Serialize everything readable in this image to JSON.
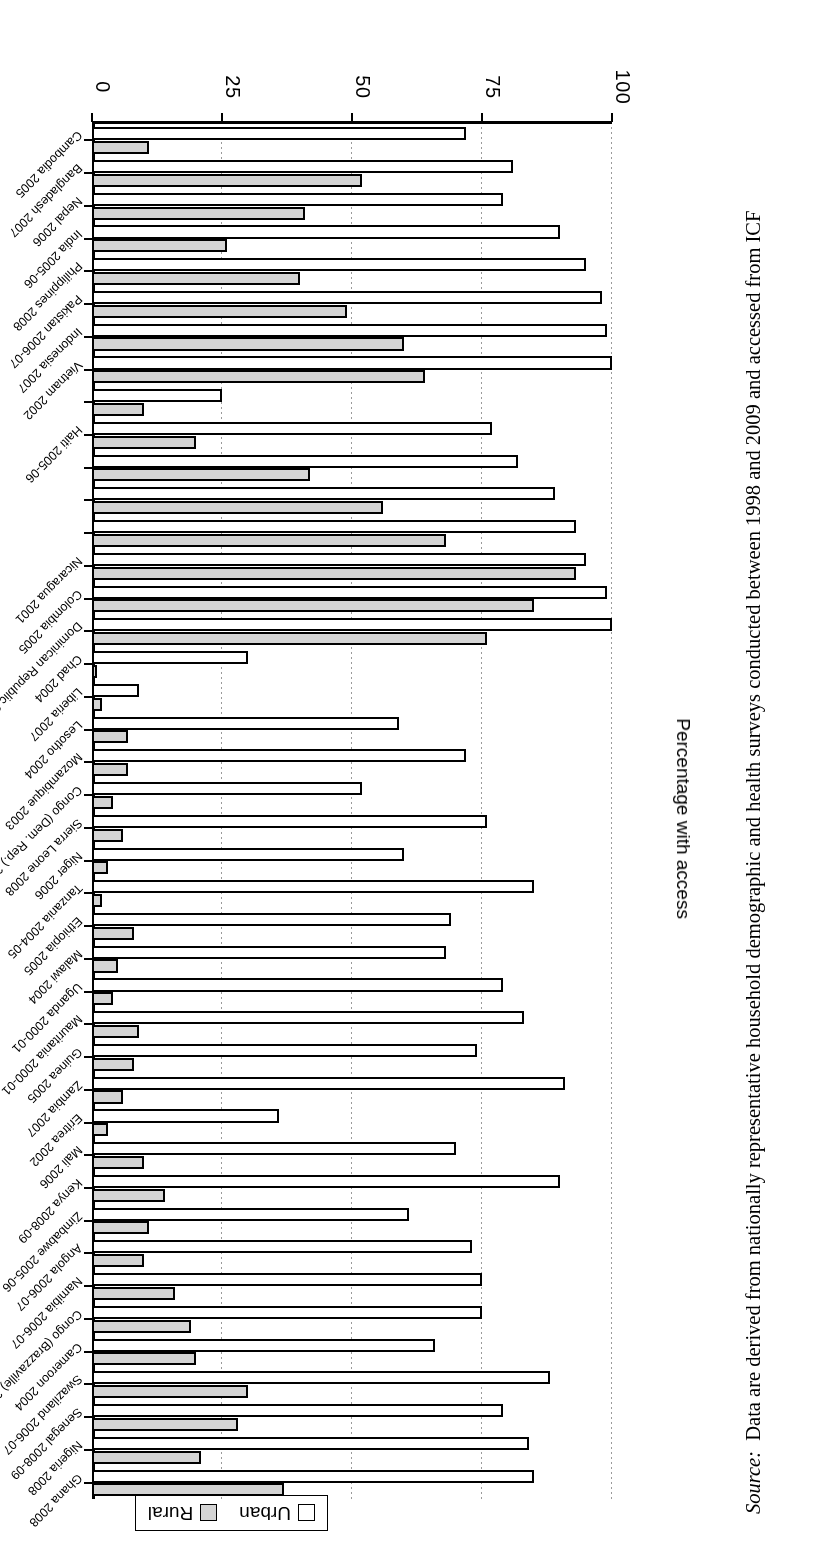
{
  "legend": {
    "items": [
      {
        "label": "Urban",
        "color": "#ffffff"
      },
      {
        "label": "Rural",
        "color": "#d4d4d4"
      }
    ]
  },
  "axis": {
    "ylabel": "Percentage with access",
    "ticks": [
      "0",
      "25",
      "50",
      "75",
      "100"
    ]
  },
  "source": {
    "prefix": "Source:",
    "text": "Data are derived from nationally representative household demographic and health surveys conducted between 1998 and 2009 and accessed from ICF"
  },
  "chart_data": {
    "type": "bar",
    "orientation": "horizontal",
    "title": "",
    "xlabel": "",
    "ylabel": "Percentage with access",
    "ylim": [
      0,
      100
    ],
    "grid": true,
    "legend_position": "top-left",
    "series_names": [
      "Urban",
      "Rural"
    ],
    "categories": [
      "Ghana 2008",
      "Nigeria 2008",
      "Senegal 2008-09",
      "Swaziland 2006-07",
      "Cameroon 2004",
      "Congo (Brazzaville) 2005",
      "Namibia 2006-07",
      "Angola 2006-07",
      "Zimbabwe 2005-06",
      "Kenya 2008-09",
      "Mali 2006",
      "Eritrea 2002",
      "Zambia 2007",
      "Guinea 2005",
      "Mauritania 2000-01",
      "Uganda 2000-01",
      "Malawi 2004",
      "Ethiopia 2005",
      "Tanzania 2004-05",
      "Niger 2006",
      "Sierra Leone 2008",
      "Congo (Dem. Rep.) 2007",
      "Mozambique 2003",
      "Lesotho 2004",
      "Liberia 2007",
      "Chad 2004",
      "Dominican Republic 2007",
      "Colombia 2005",
      "Nicaragua 2001",
      "",
      "",
      "",
      "Haiti 2005-06",
      "",
      "Vietnam 2002",
      "Indonesia 2007",
      "Pakistan 2006-07",
      "Philippines 2008",
      "India 2005-06",
      "Nepal 2006",
      "Bangladesh 2007",
      "Cambodia 2005"
    ],
    "series": [
      {
        "name": "Urban",
        "values": [
          85,
          84,
          79,
          88,
          66,
          75,
          75,
          73,
          61,
          90,
          70,
          36,
          91,
          74,
          83,
          79,
          68,
          69,
          85,
          60,
          76,
          52,
          72,
          59,
          9,
          30,
          100,
          99,
          95,
          93,
          89,
          82,
          77,
          25,
          100,
          99,
          98,
          95,
          90,
          79,
          81,
          72
        ]
      },
      {
        "name": "Rural",
        "values": [
          37,
          21,
          28,
          30,
          20,
          19,
          16,
          10,
          11,
          14,
          10,
          3,
          6,
          8,
          9,
          4,
          5,
          8,
          2,
          3,
          6,
          4,
          7,
          7,
          2,
          1,
          76,
          85,
          93,
          68,
          56,
          42,
          20,
          10,
          64,
          60,
          49,
          40,
          26,
          41,
          52,
          11
        ]
      }
    ]
  }
}
